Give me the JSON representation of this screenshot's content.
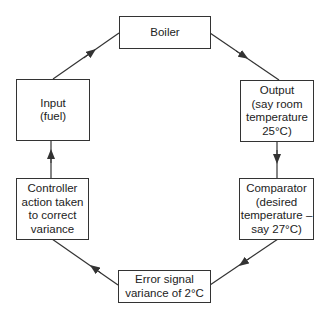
{
  "nodes": {
    "boiler": "Boiler",
    "output": "Output\n(say room\ntemperature\n25°C)",
    "comparator": "Comparator\n(desired\ntemperature –\nsay 27°C)",
    "error": "Error signal\nvariance of 2°C",
    "controller": "Controller\naction taken\nto correct\nvariance",
    "input": "Input\n(fuel)"
  },
  "flow": [
    {
      "from": "input",
      "to": "boiler"
    },
    {
      "from": "boiler",
      "to": "output"
    },
    {
      "from": "output",
      "to": "comparator"
    },
    {
      "from": "comparator",
      "to": "error"
    },
    {
      "from": "error",
      "to": "controller"
    },
    {
      "from": "controller",
      "to": "input"
    }
  ]
}
